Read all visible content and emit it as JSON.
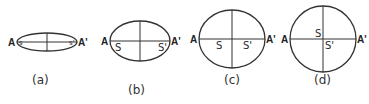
{
  "figure": {
    "panels": [
      {
        "id": "a",
        "caption": "(a)",
        "vertex_left": "A",
        "vertex_right": "A'",
        "focus_left": "s",
        "focus_right": "s'",
        "cx": 47,
        "cy": 42,
        "rx": 30,
        "ry": 9,
        "f_left_x": 22,
        "f_right_x": 72,
        "cap_x": 32,
        "cap_y": 84
      },
      {
        "id": "b",
        "caption": "(b)",
        "vertex_left": "A",
        "vertex_right": "A'",
        "focus_left": "S",
        "focus_right": "S'",
        "cx": 140,
        "cy": 41,
        "rx": 30,
        "ry": 20,
        "f_left_x": 118,
        "f_right_x": 161,
        "cap_x": 128,
        "cap_y": 94
      },
      {
        "id": "c",
        "caption": "(c)",
        "vertex_left": "A",
        "vertex_right": "A'",
        "focus_left": "S",
        "focus_right": "S'",
        "cx": 232,
        "cy": 39,
        "rx": 33,
        "ry": 29,
        "f_left_x": 219,
        "f_right_x": 246,
        "cap_x": 224,
        "cap_y": 84
      },
      {
        "id": "d",
        "caption": "(d)",
        "vertex_left": "A",
        "vertex_right": "A'",
        "focus_left": "S",
        "focus_right": "S'",
        "cx": 323,
        "cy": 39,
        "rx": 33,
        "ry": 33,
        "f_left_x": 318,
        "f_right_x": 328,
        "cap_x": 314,
        "cap_y": 84
      }
    ]
  }
}
